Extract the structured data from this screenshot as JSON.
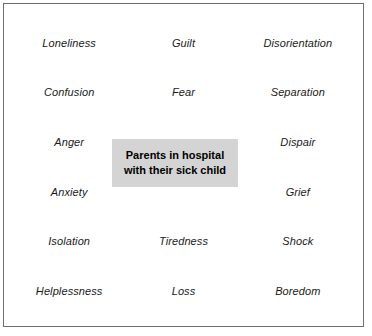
{
  "diagram": {
    "title": "Parents in hospital with their sick child",
    "center": {
      "line1": "Parents in hospital",
      "line2": "with their sick child",
      "background_color": "#d4d4d4",
      "text_color": "#000000"
    },
    "frame": {
      "border_color": "#6e6e6e",
      "background_color": "#ffffff"
    },
    "label_color": "#1a1a1a",
    "columns": [
      "left",
      "middle",
      "right"
    ],
    "rows": [
      {
        "left": "Loneliness",
        "middle": "Guilt",
        "right": "Disorientation"
      },
      {
        "left": "Confusion",
        "middle": "Fear",
        "right": "Separation"
      },
      {
        "left": "Anger",
        "middle": "",
        "right": "Dispair"
      },
      {
        "left": "Anxiety",
        "middle": "",
        "right": "Grief"
      },
      {
        "left": "Isolation",
        "middle": "Tiredness",
        "right": "Shock"
      },
      {
        "left": "Helplessness",
        "middle": "Loss",
        "right": "Boredom"
      }
    ]
  }
}
